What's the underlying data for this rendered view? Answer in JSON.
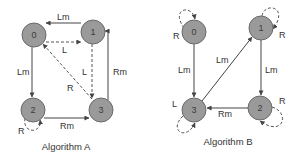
{
  "diagrams": [
    {
      "caption": "Algorithm A",
      "nodes": [
        {
          "id": "0",
          "label": "0",
          "x": 34,
          "y": 35
        },
        {
          "id": "1",
          "label": "1",
          "x": 93,
          "y": 32
        },
        {
          "id": "2",
          "label": "2",
          "x": 33,
          "y": 110
        },
        {
          "id": "3",
          "label": "3",
          "x": 101,
          "y": 110
        }
      ],
      "edges": [
        {
          "from": "1",
          "to": "0",
          "label": "Lm",
          "style": "solid"
        },
        {
          "from": "0",
          "to": "1",
          "label": "L",
          "style": "dashed"
        },
        {
          "from": "0",
          "to": "2",
          "label": "Lm",
          "style": "solid"
        },
        {
          "from": "0",
          "to": "3",
          "label": "R",
          "style": "dashed"
        },
        {
          "from": "1",
          "to": "3",
          "label": "L",
          "style": "dashed"
        },
        {
          "from": "3",
          "to": "1",
          "label": "Rm",
          "style": "solid"
        },
        {
          "from": "2",
          "to": "3",
          "label": "Rm",
          "style": "solid"
        },
        {
          "from": "2",
          "to": "2",
          "label": "R",
          "style": "dashed"
        }
      ]
    },
    {
      "caption": "Algorithm B",
      "nodes": [
        {
          "id": "0",
          "label": "0",
          "x": 194,
          "y": 32
        },
        {
          "id": "1",
          "label": "1",
          "x": 261,
          "y": 28
        },
        {
          "id": "2",
          "label": "2",
          "x": 260,
          "y": 108
        },
        {
          "id": "3",
          "label": "3",
          "x": 194,
          "y": 110
        }
      ],
      "edges": [
        {
          "from": "0",
          "to": "3",
          "label": "Lm",
          "style": "solid"
        },
        {
          "from": "3",
          "to": "1",
          "label": "Lm",
          "style": "solid"
        },
        {
          "from": "1",
          "to": "2",
          "label": "Lm",
          "style": "solid"
        },
        {
          "from": "2",
          "to": "3",
          "label": "Rm",
          "style": "solid"
        },
        {
          "from": "0",
          "to": "0",
          "label": "R",
          "style": "dashed"
        },
        {
          "from": "1",
          "to": "1",
          "label": "R",
          "style": "dashed"
        },
        {
          "from": "2",
          "to": "2",
          "label": "R",
          "style": "dashed"
        },
        {
          "from": "3",
          "to": "3",
          "label": "L",
          "style": "dashed"
        }
      ]
    }
  ],
  "colors": {
    "node_fill": "#9a9a9a",
    "node_stroke": "#6a6a6a",
    "edge": "#444444",
    "text": "#333333",
    "background": "#ffffff"
  }
}
